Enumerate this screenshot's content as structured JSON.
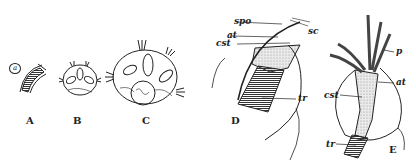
{
  "figure": {
    "panels": [
      {
        "id": "A",
        "label": "A",
        "inset_label": "a"
      },
      {
        "id": "B",
        "label": "B"
      },
      {
        "id": "C",
        "label": "C"
      },
      {
        "id": "D",
        "label": "D",
        "annotations": [
          "spo",
          "sc",
          "at",
          "cst",
          "tr"
        ]
      },
      {
        "id": "E",
        "label": "E",
        "annotations": [
          "p",
          "at",
          "cst",
          "tr"
        ]
      }
    ],
    "annotations": {
      "spo": "spo",
      "sc": "sc",
      "at_d": "at",
      "cst_d": "cst",
      "tr_d": "tr",
      "p": "p",
      "at_e": "at",
      "cst_e": "cst",
      "tr_e": "tr"
    },
    "colors": {
      "ink": "#222222",
      "background": "#ffffff",
      "stipple": "#d8d8d8"
    }
  }
}
